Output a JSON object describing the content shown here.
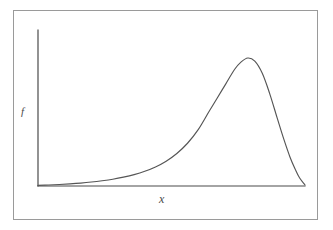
{
  "figure": {
    "background_color": "#ffffff",
    "frame_color": "#9a9a9a",
    "axis_color": "#4a4a4a",
    "curve_color": "#555555"
  },
  "labels": {
    "y_axis": "f",
    "x_axis": "x"
  },
  "chart_data": {
    "type": "line",
    "title": "",
    "subtitle": "",
    "xlabel": "x",
    "ylabel": "f",
    "grid": false,
    "legend": null,
    "xticks": [],
    "yticks": [],
    "xlim": [
      0,
      1
    ],
    "ylim": [
      0,
      1
    ],
    "annotations": [],
    "series": [
      {
        "name": "density",
        "skew": "left",
        "peak": {
          "x": 0.786,
          "y": 1.0
        },
        "points_x": [
          0.0,
          0.04,
          0.08,
          0.12,
          0.16,
          0.2,
          0.24,
          0.28,
          0.32,
          0.36,
          0.4,
          0.44,
          0.48,
          0.52,
          0.56,
          0.6,
          0.64,
          0.672,
          0.704,
          0.736,
          0.76,
          0.786,
          0.812,
          0.84,
          0.868,
          0.896,
          0.92,
          0.944,
          0.964,
          0.98,
          1.0
        ],
        "points_y": [
          0.005,
          0.008,
          0.012,
          0.017,
          0.023,
          0.031,
          0.041,
          0.053,
          0.069,
          0.089,
          0.115,
          0.149,
          0.194,
          0.254,
          0.334,
          0.44,
          0.58,
          0.69,
          0.8,
          0.91,
          0.968,
          1.0,
          0.975,
          0.88,
          0.72,
          0.53,
          0.37,
          0.225,
          0.128,
          0.062,
          0.008
        ]
      }
    ]
  },
  "geometry": {
    "axis_origin_x": 38,
    "axis_origin_y": 186,
    "axis_top_y": 30,
    "axis_right_x": 305
  }
}
